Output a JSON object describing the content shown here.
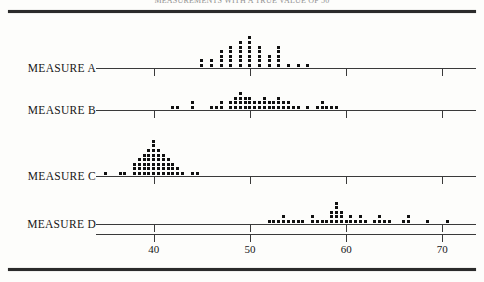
{
  "figure": {
    "caption_clipped": "MEASUREMENTS WITH A TRUE VALUE OF 50",
    "axis": {
      "ticks": [
        40,
        50,
        60,
        70
      ],
      "tick_labels": [
        "40",
        "50",
        "60",
        "70"
      ],
      "xmin": 34,
      "xmax": 73.5
    },
    "rows": [
      {
        "label": "MEASURE A"
      },
      {
        "label": "MEASURE B"
      },
      {
        "label": "MEASURE C"
      },
      {
        "label": "MEASURE D"
      }
    ],
    "colors": {
      "ink": "#111111",
      "rule": "#2b2b2b",
      "axis": "#3a3a3a",
      "paper": "#fdfdfb"
    }
  },
  "chart_data": {
    "type": "scatter",
    "title": "MEASUREMENTS WITH A TRUE VALUE OF 50",
    "xlabel": "",
    "ylabel": "",
    "xlim": [
      34,
      73.5
    ],
    "grid": false,
    "legend": "none",
    "plot_style": "stacked dot plot (one dot per observation)",
    "series": [
      {
        "name": "MEASURE A",
        "values": [
          45,
          45,
          46,
          46,
          47,
          47,
          47,
          47,
          48,
          48,
          48,
          48,
          48,
          49,
          49,
          49,
          49,
          49,
          49,
          50,
          50,
          50,
          50,
          50,
          50,
          50,
          51,
          51,
          51,
          51,
          51,
          52,
          52,
          52,
          53,
          53,
          53,
          53,
          53,
          54,
          55,
          56
        ],
        "stacks": [
          {
            "x": 45,
            "count": 2
          },
          {
            "x": 46,
            "count": 2
          },
          {
            "x": 47,
            "count": 4
          },
          {
            "x": 48,
            "count": 5
          },
          {
            "x": 49,
            "count": 6
          },
          {
            "x": 50,
            "count": 7
          },
          {
            "x": 51,
            "count": 5
          },
          {
            "x": 52,
            "count": 3
          },
          {
            "x": 53,
            "count": 5
          },
          {
            "x": 54,
            "count": 1
          },
          {
            "x": 55,
            "count": 1
          },
          {
            "x": 56,
            "count": 1
          }
        ]
      },
      {
        "name": "MEASURE B",
        "stacks": [
          {
            "x": 42,
            "count": 1
          },
          {
            "x": 42.5,
            "count": 1
          },
          {
            "x": 44,
            "count": 2
          },
          {
            "x": 46,
            "count": 1
          },
          {
            "x": 46.5,
            "count": 1
          },
          {
            "x": 47,
            "count": 2
          },
          {
            "x": 48,
            "count": 2
          },
          {
            "x": 48.5,
            "count": 3
          },
          {
            "x": 49,
            "count": 4
          },
          {
            "x": 49.5,
            "count": 3
          },
          {
            "x": 50,
            "count": 3
          },
          {
            "x": 50.5,
            "count": 2
          },
          {
            "x": 51,
            "count": 2
          },
          {
            "x": 51.5,
            "count": 3
          },
          {
            "x": 52,
            "count": 2
          },
          {
            "x": 52.5,
            "count": 2
          },
          {
            "x": 53,
            "count": 3
          },
          {
            "x": 53.5,
            "count": 2
          },
          {
            "x": 54,
            "count": 2
          },
          {
            "x": 54.5,
            "count": 1
          },
          {
            "x": 55,
            "count": 1
          },
          {
            "x": 56,
            "count": 1
          },
          {
            "x": 57,
            "count": 1
          },
          {
            "x": 57.5,
            "count": 2
          },
          {
            "x": 58,
            "count": 1
          },
          {
            "x": 58.5,
            "count": 1
          },
          {
            "x": 59,
            "count": 1
          }
        ]
      },
      {
        "name": "MEASURE C",
        "stacks": [
          {
            "x": 35,
            "count": 1
          },
          {
            "x": 36.5,
            "count": 1
          },
          {
            "x": 37,
            "count": 1
          },
          {
            "x": 38,
            "count": 3
          },
          {
            "x": 38.5,
            "count": 4
          },
          {
            "x": 39,
            "count": 5
          },
          {
            "x": 39.5,
            "count": 6
          },
          {
            "x": 40,
            "count": 8
          },
          {
            "x": 40.5,
            "count": 6
          },
          {
            "x": 41,
            "count": 5
          },
          {
            "x": 41.5,
            "count": 4
          },
          {
            "x": 42,
            "count": 3
          },
          {
            "x": 42.5,
            "count": 2
          },
          {
            "x": 43,
            "count": 1
          },
          {
            "x": 44,
            "count": 1
          },
          {
            "x": 44.5,
            "count": 1
          }
        ]
      },
      {
        "name": "MEASURE D",
        "stacks": [
          {
            "x": 52,
            "count": 1
          },
          {
            "x": 52.5,
            "count": 1
          },
          {
            "x": 53,
            "count": 1
          },
          {
            "x": 53.5,
            "count": 2
          },
          {
            "x": 54,
            "count": 1
          },
          {
            "x": 54.5,
            "count": 1
          },
          {
            "x": 55,
            "count": 1
          },
          {
            "x": 55.5,
            "count": 1
          },
          {
            "x": 56.5,
            "count": 2
          },
          {
            "x": 57,
            "count": 1
          },
          {
            "x": 57.5,
            "count": 1
          },
          {
            "x": 58,
            "count": 1
          },
          {
            "x": 58.5,
            "count": 3
          },
          {
            "x": 59,
            "count": 5
          },
          {
            "x": 59.5,
            "count": 3
          },
          {
            "x": 60,
            "count": 1
          },
          {
            "x": 60.5,
            "count": 2
          },
          {
            "x": 61,
            "count": 1
          },
          {
            "x": 61.5,
            "count": 2
          },
          {
            "x": 62,
            "count": 1
          },
          {
            "x": 63,
            "count": 1
          },
          {
            "x": 63.5,
            "count": 2
          },
          {
            "x": 64,
            "count": 1
          },
          {
            "x": 64.5,
            "count": 1
          },
          {
            "x": 66,
            "count": 1
          },
          {
            "x": 66.5,
            "count": 2
          },
          {
            "x": 68.5,
            "count": 1
          },
          {
            "x": 70.5,
            "count": 1
          }
        ]
      }
    ]
  }
}
